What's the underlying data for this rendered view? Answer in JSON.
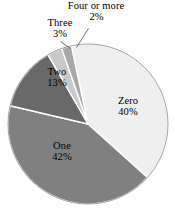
{
  "chart_data": {
    "type": "pie",
    "title": "",
    "categories": [
      "Zero",
      "One",
      "Two",
      "Three",
      "Four or more"
    ],
    "values": [
      40,
      42,
      13,
      3,
      2
    ],
    "value_suffix": "%",
    "legend": "none",
    "grid": false,
    "start_angle_deg": -12,
    "direction": "clockwise",
    "colors": [
      "#efefef",
      "#808080",
      "#696969",
      "#c9c9c9",
      "#a8a8a8"
    ],
    "slice_border_color": "#ffffff",
    "outline_color": "#8a8a8a",
    "labels": [
      {
        "name": "Zero",
        "label": "Zero",
        "percent": "40%",
        "placement": "inside"
      },
      {
        "name": "One",
        "label": "One",
        "percent": "42%",
        "placement": "inside"
      },
      {
        "name": "Two",
        "label": "Two",
        "percent": "13%",
        "placement": "inside"
      },
      {
        "name": "Three",
        "label": "Three",
        "percent": "3%",
        "placement": "outside"
      },
      {
        "name": "Four or more",
        "label": "Four or more",
        "percent": "2%",
        "placement": "outside-leader"
      }
    ]
  },
  "labels": {
    "four": {
      "name": "Four or more",
      "percent": "2%"
    },
    "three": {
      "name": "Three",
      "percent": "3%"
    },
    "two": {
      "name": "Two",
      "percent": "13%"
    },
    "zero": {
      "name": "Zero",
      "percent": "40%"
    },
    "one": {
      "name": "One",
      "percent": "42%"
    }
  }
}
